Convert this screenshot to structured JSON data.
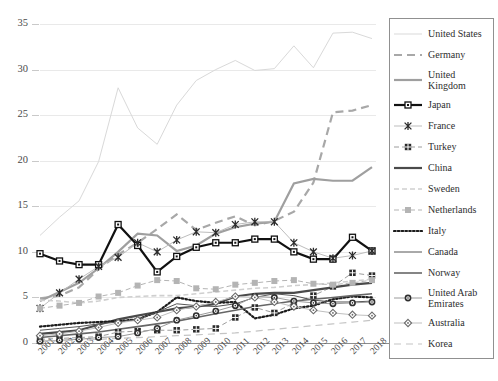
{
  "chart_data": {
    "type": "line",
    "title": "",
    "xlabel": "",
    "ylabel": "",
    "grid": true,
    "legend_position": "right",
    "ylim": [
      0,
      35
    ],
    "yticks": [
      0,
      5,
      10,
      15,
      20,
      25,
      30,
      35
    ],
    "categories": [
      "2001",
      "2002",
      "2003",
      "2004",
      "2005",
      "2006",
      "2007",
      "2008",
      "2009",
      "2010",
      "2011",
      "2012",
      "2013",
      "2014",
      "2015",
      "2016",
      "2017",
      "2018"
    ],
    "series": [
      {
        "name": "United States",
        "color": "#d9d9d9",
        "style": "solid-thin",
        "marker": "none",
        "values": [
          11.8,
          13.8,
          15.6,
          19.9,
          28.0,
          23.6,
          21.8,
          26.1,
          28.8,
          30.0,
          31.0,
          29.9,
          30.1,
          32.6,
          30.2,
          34.0,
          34.1,
          33.4
        ]
      },
      {
        "name": "Germany",
        "color": "#a8a8a8",
        "style": "dashed-thick",
        "marker": "none",
        "values": [
          4.9,
          5.2,
          6.1,
          8.1,
          9.7,
          11.0,
          12.5,
          14.1,
          12.4,
          13.2,
          13.9,
          12.9,
          13.4,
          14.4,
          17.6,
          25.3,
          25.5,
          26.1
        ]
      },
      {
        "name": "United Kingdom",
        "color": "#9f9f9f",
        "style": "solid-thick",
        "marker": "none",
        "values": [
          4.6,
          5.6,
          6.6,
          8.2,
          10.0,
          12.0,
          11.8,
          10.1,
          10.7,
          12.0,
          12.7,
          13.1,
          13.3,
          17.5,
          18.0,
          17.8,
          17.8,
          19.3
        ]
      },
      {
        "name": "Japan",
        "color": "#111111",
        "style": "solid-thick",
        "marker": "square-open",
        "values": [
          9.8,
          9.0,
          8.6,
          8.6,
          13.0,
          10.7,
          7.8,
          9.5,
          10.5,
          11.0,
          11.0,
          11.4,
          11.4,
          10.0,
          9.2,
          9.2,
          11.6,
          10.1
        ]
      },
      {
        "name": "France",
        "color": "#bdbdbd",
        "style": "solid-thin",
        "marker": "star",
        "values": [
          3.8,
          5.5,
          7.0,
          8.4,
          9.4,
          11.0,
          10.0,
          11.3,
          12.2,
          12.1,
          13.0,
          13.3,
          13.3,
          11.0,
          10.0,
          9.3,
          9.6,
          10.1
        ]
      },
      {
        "name": "Turkey",
        "color": "#9c9c9c",
        "style": "dashed-thin",
        "marker": "square-grid",
        "values": [
          0.4,
          0.5,
          0.6,
          0.7,
          1.2,
          1.3,
          1.4,
          1.4,
          1.5,
          1.6,
          2.8,
          3.9,
          3.3,
          4.4,
          5.2,
          6.2,
          7.7,
          7.4
        ]
      },
      {
        "name": "China",
        "color": "#4a4a4a",
        "style": "solid-thick",
        "marker": "none",
        "values": [
          1.0,
          1.2,
          1.4,
          2.0,
          2.6,
          3.0,
          3.4,
          3.8,
          4.0,
          4.3,
          5.1,
          5.4,
          5.5,
          5.5,
          5.8,
          6.1,
          6.4,
          6.6
        ]
      },
      {
        "name": "Sweden",
        "color": "#cfcfcf",
        "style": "dashed-medium",
        "marker": "none",
        "values": [
          4.7,
          4.6,
          4.4,
          4.6,
          5.0,
          5.1,
          5.2,
          5.2,
          5.4,
          5.6,
          5.8,
          6.0,
          6.1,
          6.3,
          6.4,
          6.6,
          6.8,
          7.0
        ]
      },
      {
        "name": "Netherlands",
        "color": "#b4b4b4",
        "style": "dashed-thin",
        "marker": "square-filled",
        "values": [
          3.8,
          4.1,
          4.4,
          5.1,
          5.5,
          6.3,
          6.9,
          6.8,
          6.0,
          5.9,
          6.4,
          6.6,
          6.8,
          6.9,
          6.5,
          6.4,
          6.6,
          6.9
        ]
      },
      {
        "name": "Italy",
        "color": "#1b1b1b",
        "style": "dotted",
        "marker": "none",
        "values": [
          1.8,
          2.0,
          2.2,
          2.3,
          2.4,
          2.6,
          3.4,
          5.0,
          4.6,
          4.4,
          4.5,
          2.7,
          3.1,
          3.8,
          4.1,
          4.8,
          5.1,
          5.0
        ]
      },
      {
        "name": "Canada",
        "color": "#555555",
        "style": "solid-thin",
        "marker": "none",
        "values": [
          1.4,
          1.6,
          1.8,
          2.1,
          2.3,
          2.6,
          3.4,
          4.3,
          4.1,
          4.0,
          4.3,
          5.0,
          5.4,
          5.2,
          4.7,
          4.5,
          4.5,
          4.6
        ]
      },
      {
        "name": "Norway",
        "color": "#666666",
        "style": "solid-medium",
        "marker": "none",
        "values": [
          0.6,
          0.8,
          1.0,
          1.2,
          1.5,
          1.8,
          2.1,
          2.4,
          2.8,
          3.2,
          3.6,
          4.0,
          4.3,
          4.6,
          4.8,
          5.0,
          5.2,
          5.4
        ]
      },
      {
        "name": "United Arab Emirates",
        "color": "#9a9a9a",
        "style": "solid-thin",
        "marker": "circle-target",
        "values": [
          0.2,
          0.3,
          0.4,
          0.6,
          0.7,
          1.1,
          1.6,
          2.5,
          3.0,
          3.5,
          4.1,
          5.1,
          5.0,
          4.6,
          4.4,
          4.3,
          4.4,
          4.5
        ]
      },
      {
        "name": "Australia",
        "color": "#bfbfbf",
        "style": "solid-thin",
        "marker": "diamond-open",
        "values": [
          0.8,
          1.0,
          1.3,
          1.7,
          2.2,
          2.5,
          2.8,
          3.6,
          4.0,
          4.5,
          5.1,
          5.0,
          4.5,
          4.0,
          3.6,
          3.3,
          3.1,
          3.0
        ]
      },
      {
        "name": "Korea",
        "color": "#c4c4c4",
        "style": "dashed-long",
        "marker": "none",
        "values": [
          0.2,
          0.25,
          0.3,
          0.4,
          0.5,
          0.6,
          0.7,
          0.8,
          0.9,
          1.0,
          1.1,
          1.3,
          1.5,
          1.7,
          1.9,
          2.1,
          2.3,
          2.5
        ]
      }
    ]
  },
  "legend": {
    "entries": [
      {
        "label": "United States"
      },
      {
        "label": "Germany"
      },
      {
        "label": "United Kingdom"
      },
      {
        "label": "Japan"
      },
      {
        "label": "France"
      },
      {
        "label": "Turkey"
      },
      {
        "label": "China"
      },
      {
        "label": "Sweden"
      },
      {
        "label": "Netherlands"
      },
      {
        "label": "Italy"
      },
      {
        "label": "Canada"
      },
      {
        "label": "Norway"
      },
      {
        "label": "United Arab Emirates"
      },
      {
        "label": "Australia"
      },
      {
        "label": "Korea"
      }
    ]
  }
}
